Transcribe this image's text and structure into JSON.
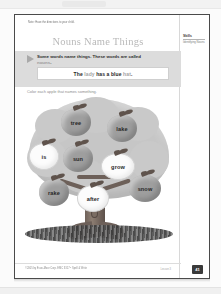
{
  "app": {
    "background_color": "#fbfbfb",
    "sheet_border_color": "#4a4a4a"
  },
  "worksheet": {
    "note_line": "Note: Have the directions to your child.",
    "title": "Nouns Name Things",
    "teaching": {
      "line_before": "Some words name things. These words are called ",
      "highlight_word": "nouns",
      "line_after": "."
    },
    "example": {
      "word1": "The ",
      "noun1": "lady",
      "word2": " has a blue ",
      "noun2": "hat",
      "word3": "."
    },
    "directions": "Color each apple that names something."
  },
  "skills_panel": {
    "title": "Skills",
    "body": "Identifying Nouns"
  },
  "tree": {
    "apples": [
      {
        "word": "tree",
        "is_noun": true,
        "state": "colored"
      },
      {
        "word": "lake",
        "is_noun": true,
        "state": "colored"
      },
      {
        "word": "is",
        "is_noun": false,
        "state": "white"
      },
      {
        "word": "sun",
        "is_noun": true,
        "state": "colored"
      },
      {
        "word": "grow",
        "is_noun": false,
        "state": "white"
      },
      {
        "word": "rake",
        "is_noun": true,
        "state": "colored"
      },
      {
        "word": "after",
        "is_noun": false,
        "state": "white"
      },
      {
        "word": "snow",
        "is_noun": true,
        "state": "colored"
      }
    ]
  },
  "footer": {
    "copyright": "©2005 by Evan-Moor Corp. EMC 3317 • Spell & Write",
    "right_note": "Lesson 3",
    "page_number": "41"
  },
  "colors": {
    "apple_noun": "#9e9e9e",
    "apple_plain": "#fcfcfc",
    "teach_band": "#dcdcdc",
    "canopy": "#c6c6c6",
    "trunk": "#6f625a",
    "title_gray": "#b9b9b9"
  }
}
